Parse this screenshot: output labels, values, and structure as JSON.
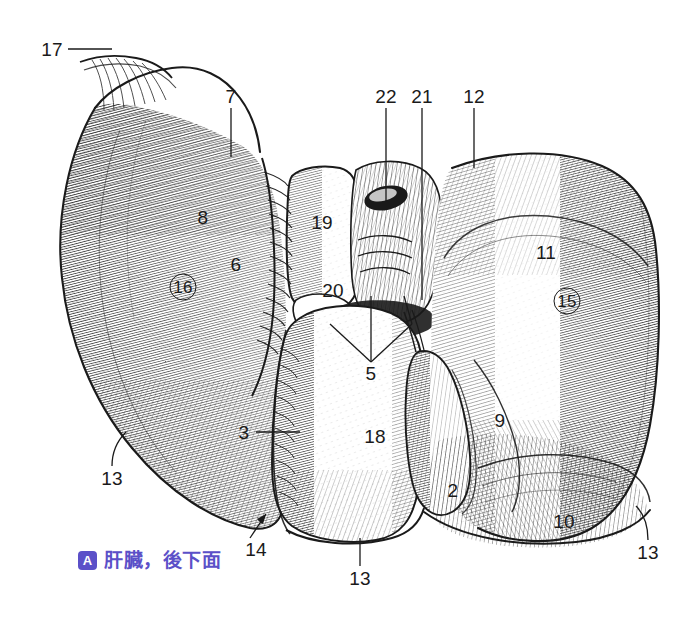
{
  "figure": {
    "caption_badge": "A",
    "caption_text": "肝臓，後下面",
    "caption_color": "#5b50c8",
    "ink_color": "#1a1a1a",
    "background_color": "#ffffff",
    "view": "posteroinferior surface of the liver",
    "labels": [
      {
        "id": "17",
        "text": "17",
        "x": 52,
        "y": 49,
        "circled": false,
        "leader": "horizontal-right"
      },
      {
        "id": "7",
        "text": "7",
        "x": 231,
        "y": 96,
        "circled": false,
        "leader": "vertical-down"
      },
      {
        "id": "22",
        "text": "22",
        "x": 386,
        "y": 96,
        "circled": false,
        "leader": "vertical-down"
      },
      {
        "id": "21",
        "text": "21",
        "x": 422,
        "y": 96,
        "circled": false,
        "leader": "vertical-down"
      },
      {
        "id": "12",
        "text": "12",
        "x": 474,
        "y": 96,
        "circled": false,
        "leader": "vertical-down"
      },
      {
        "id": "8",
        "text": "8",
        "x": 203,
        "y": 217,
        "circled": false,
        "leader": "none"
      },
      {
        "id": "19",
        "text": "19",
        "x": 322,
        "y": 222,
        "circled": false,
        "leader": "none"
      },
      {
        "id": "11",
        "text": "11",
        "x": 546,
        "y": 252,
        "circled": false,
        "leader": "none"
      },
      {
        "id": "6",
        "text": "6",
        "x": 236,
        "y": 264,
        "circled": false,
        "leader": "none"
      },
      {
        "id": "16",
        "text": "16",
        "x": 183,
        "y": 287,
        "circled": true,
        "leader": "none"
      },
      {
        "id": "20",
        "text": "20",
        "x": 333,
        "y": 290,
        "circled": false,
        "leader": "none"
      },
      {
        "id": "15",
        "text": "15",
        "x": 567,
        "y": 301,
        "circled": true,
        "leader": "none"
      },
      {
        "id": "5",
        "text": "5",
        "x": 371,
        "y": 373,
        "circled": false,
        "leader": "fan-up"
      },
      {
        "id": "9",
        "text": "9",
        "x": 500,
        "y": 420,
        "circled": false,
        "leader": "none"
      },
      {
        "id": "3",
        "text": "3",
        "x": 244,
        "y": 432,
        "circled": false,
        "leader": "horizontal-right"
      },
      {
        "id": "18",
        "text": "18",
        "x": 375,
        "y": 436,
        "circled": false,
        "leader": "none"
      },
      {
        "id": "13-left",
        "text": "13",
        "x": 112,
        "y": 478,
        "circled": false,
        "leader": "diagonal-up-right"
      },
      {
        "id": "2",
        "text": "2",
        "x": 453,
        "y": 490,
        "circled": false,
        "leader": "none"
      },
      {
        "id": "10",
        "text": "10",
        "x": 564,
        "y": 521,
        "circled": false,
        "leader": "none"
      },
      {
        "id": "14",
        "text": "14",
        "x": 256,
        "y": 549,
        "circled": false,
        "leader": "arrow-up-right"
      },
      {
        "id": "13-right",
        "text": "13",
        "x": 648,
        "y": 552,
        "circled": false,
        "leader": "diagonal-up-left"
      },
      {
        "id": "13-bottom",
        "text": "13",
        "x": 360,
        "y": 578,
        "circled": false,
        "leader": "vertical-up"
      }
    ]
  }
}
